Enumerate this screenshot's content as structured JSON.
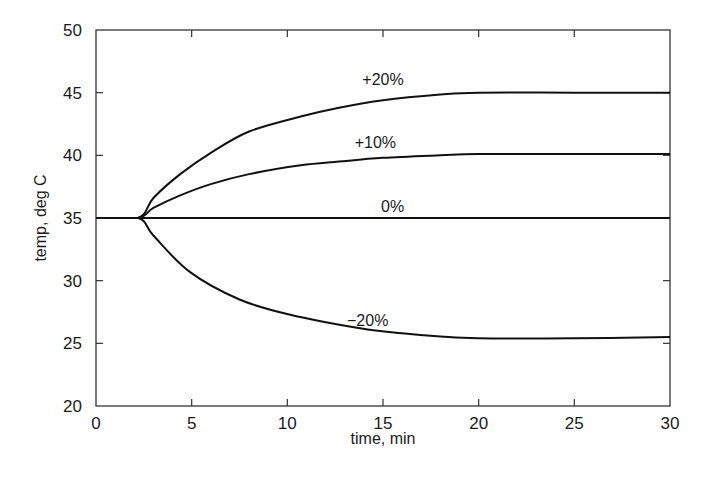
{
  "chart_data": {
    "type": "line",
    "title": "",
    "xlabel": "time, min",
    "ylabel": "temp, deg C",
    "xlim": [
      0,
      30
    ],
    "ylim": [
      20,
      50
    ],
    "xticks": [
      0,
      5,
      10,
      15,
      20,
      25,
      30
    ],
    "yticks": [
      20,
      25,
      30,
      35,
      40,
      45,
      50
    ],
    "grid": false,
    "legend": "inline labels on curves",
    "series": [
      {
        "name": "+20%",
        "label_pos": [
          15,
          45.6
        ],
        "x": [
          0,
          2.2,
          3,
          4.4,
          6,
          8,
          10.7,
          12.7,
          15,
          18,
          20,
          25,
          30
        ],
        "y": [
          35,
          35,
          36.6,
          38.5,
          40.2,
          41.9,
          43.1,
          43.8,
          44.4,
          44.85,
          45,
          45,
          45
        ]
      },
      {
        "name": "+10%",
        "label_pos": [
          14.6,
          40.6
        ],
        "x": [
          0,
          2.2,
          3,
          4.4,
          6,
          8,
          10.7,
          12.7,
          15,
          18,
          20,
          25,
          30
        ],
        "y": [
          35,
          35,
          35.8,
          36.8,
          37.7,
          38.5,
          39.2,
          39.5,
          39.8,
          40,
          40.1,
          40.1,
          40.1
        ]
      },
      {
        "name": "0%",
        "label_pos": [
          15.5,
          35.5
        ],
        "x": [
          0,
          30
        ],
        "y": [
          35,
          35
        ]
      },
      {
        "name": "−20%",
        "label_pos": [
          14.2,
          26.4
        ],
        "x": [
          0,
          2.2,
          3,
          4.9,
          7.5,
          10.1,
          13.8,
          16,
          18,
          20,
          25,
          30
        ],
        "y": [
          35,
          35,
          33.6,
          30.7,
          28.5,
          27.3,
          26.2,
          25.8,
          25.55,
          25.4,
          25.4,
          25.5
        ]
      }
    ]
  },
  "axes": {
    "x_title": "time, min",
    "y_title": "temp, deg C"
  }
}
